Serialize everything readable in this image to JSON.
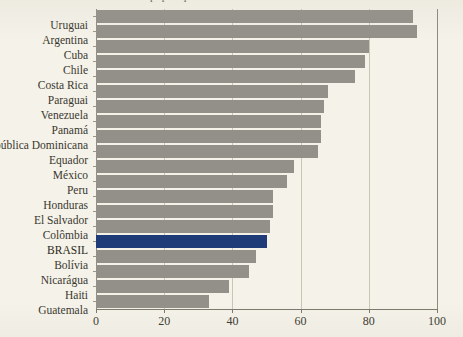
{
  "title": "população",
  "chart_data": {
    "type": "bar",
    "orientation": "horizontal",
    "title": "população",
    "xlabel": "",
    "ylabel": "",
    "xlim": [
      0,
      100
    ],
    "xticks": [
      0,
      20,
      40,
      60,
      80,
      100
    ],
    "grid": true,
    "legend": false,
    "categories": [
      "Uruguai",
      "Argentina",
      "Cuba",
      "Chile",
      "Costa Rica",
      "Paraguai",
      "Venezuela",
      "Panamá",
      "República Dominicana",
      "Equador",
      "México",
      "Peru",
      "Honduras",
      "El Salvador",
      "Colômbia",
      "BRASIL",
      "Bolívia",
      "Nicarágua",
      "Haiti",
      "Guatemala"
    ],
    "values": [
      93,
      94,
      80,
      79,
      76,
      68,
      67,
      66,
      66,
      65,
      58,
      56,
      52,
      52,
      51,
      50,
      47,
      45,
      39,
      33
    ],
    "highlight_category": "BRASIL",
    "colors": {
      "bar": "#93908a",
      "highlight": "#1f3c79",
      "background": "#f4f2e9",
      "gridline": "#c9c6b6",
      "axis": "#7c796c",
      "text": "#3a382f"
    }
  }
}
